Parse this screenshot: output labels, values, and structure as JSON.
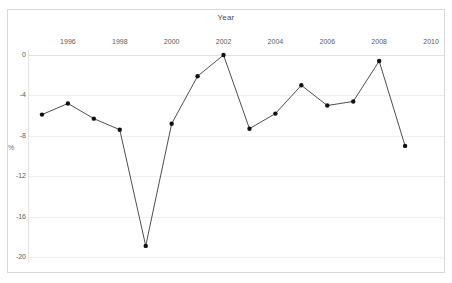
{
  "chart_data": {
    "type": "line",
    "title": "Year",
    "xlabel": "Year",
    "ylabel": "%",
    "categories": [
      1995,
      1996,
      1997,
      1998,
      1999,
      2000,
      2001,
      2002,
      2003,
      2004,
      2005,
      2006,
      2007,
      2008,
      2009
    ],
    "x": [
      1995,
      1996,
      1997,
      1998,
      1999,
      2000,
      2001,
      2002,
      2003,
      2004,
      2005,
      2006,
      2007,
      2008,
      2009
    ],
    "values": [
      -5.9,
      -4.8,
      -6.3,
      -7.4,
      -18.9,
      -6.8,
      -2.1,
      0.0,
      -7.3,
      -5.8,
      -3.0,
      -5.0,
      -4.6,
      -0.6,
      -9.0
    ],
    "series": [
      {
        "name": "%",
        "values": [
          -5.9,
          -4.8,
          -6.3,
          -7.4,
          -18.9,
          -6.8,
          -2.1,
          0.0,
          -7.3,
          -5.8,
          -3.0,
          -5.0,
          -4.6,
          -0.6,
          -9.0
        ]
      }
    ],
    "xlim": [
      1994.5,
      2010.5
    ],
    "ylim": [
      -20,
      0
    ],
    "ytick_labels": [
      "0",
      "-4",
      "-8",
      "-12",
      "-16",
      "-20"
    ],
    "ytick_values": [
      0,
      -4,
      -8,
      -12,
      -16,
      -20
    ],
    "xtick_labels": [
      "1996",
      "1998",
      "2000",
      "2002",
      "2004",
      "2006",
      "2008",
      "2010"
    ],
    "xtick_values": [
      1996,
      1998,
      2000,
      2002,
      2004,
      2006,
      2008,
      2010
    ],
    "grid": true,
    "legend": null,
    "line_color": "#3a3a3a",
    "marker_color": "#111111",
    "grid_color": "#eeeeee",
    "background_color": "#ffffff"
  },
  "axes": {
    "title_text": "Year",
    "ylabel_text": "%"
  }
}
